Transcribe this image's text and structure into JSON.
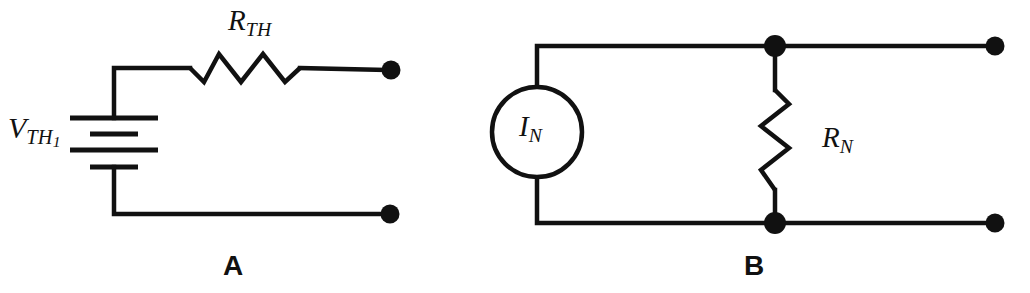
{
  "figure": {
    "background_color": "#ffffff",
    "line_color": "#111111"
  },
  "panels": [
    {
      "id": "A",
      "caption": "A",
      "type": "thevenin-equivalent",
      "components": [
        {
          "name": "voltage-source",
          "label_main": "V",
          "label_sub": "TH",
          "label_subsub": "1",
          "symbol": "battery-4-plate"
        },
        {
          "name": "resistor",
          "label_main": "R",
          "label_sub": "TH",
          "symbol": "zigzag-horizontal"
        },
        {
          "name": "terminal-top",
          "symbol": "filled-dot"
        },
        {
          "name": "terminal-bottom",
          "symbol": "filled-dot"
        }
      ]
    },
    {
      "id": "B",
      "caption": "B",
      "type": "norton-equivalent",
      "components": [
        {
          "name": "current-source",
          "label_main": "I",
          "label_sub": "N",
          "symbol": "circle-source"
        },
        {
          "name": "resistor",
          "label_main": "R",
          "label_sub": "N",
          "symbol": "zigzag-vertical"
        },
        {
          "name": "junction-top",
          "symbol": "filled-dot"
        },
        {
          "name": "junction-bottom",
          "symbol": "filled-dot"
        },
        {
          "name": "terminal-top",
          "symbol": "filled-dot"
        },
        {
          "name": "terminal-bottom",
          "symbol": "filled-dot"
        }
      ]
    }
  ],
  "labels": {
    "vth_main": "V",
    "vth_sub": "TH",
    "vth_subsub": "1",
    "rth_main": "R",
    "rth_sub": "TH",
    "in_main": "I",
    "in_sub": "N",
    "rn_main": "R",
    "rn_sub": "N",
    "caption_a": "A",
    "caption_b": "B"
  }
}
